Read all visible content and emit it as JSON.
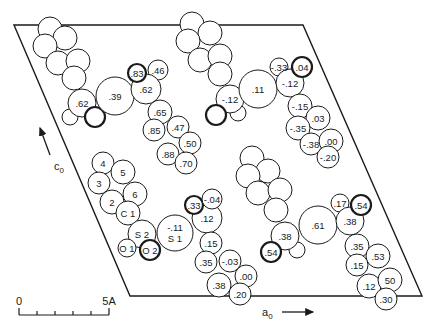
{
  "figure": {
    "type": "crystal-packing-projection",
    "unit_cell": {
      "points": [
        [
          14,
          25
        ],
        [
          303,
          25
        ],
        [
          422,
          296
        ],
        [
          130,
          296
        ]
      ]
    },
    "axes": {
      "c0": {
        "label": "c",
        "subscript": "0",
        "arrow": [
          [
            50,
            155
          ],
          [
            40,
            128
          ]
        ],
        "label_pos": [
          54,
          170
        ]
      },
      "a0": {
        "label": "a",
        "subscript": "0",
        "arrow": [
          [
            282,
            312
          ],
          [
            313,
            312
          ]
        ],
        "label_pos": [
          262,
          316
        ]
      }
    },
    "scale_bar": {
      "x0": 19,
      "x1": 109,
      "y": 315,
      "ticks": 5,
      "start_label": "0",
      "end_label": "5A"
    },
    "molecules": [
      {
        "name": "top-left-molecule",
        "atoms": [
          {
            "x": 50,
            "y": 29,
            "r": 12,
            "label": ""
          },
          {
            "x": 65,
            "y": 38,
            "r": 12,
            "label": ""
          },
          {
            "x": 45,
            "y": 46,
            "r": 12,
            "label": ""
          },
          {
            "x": 58,
            "y": 63,
            "r": 12,
            "label": ""
          },
          {
            "x": 78,
            "y": 61,
            "r": 12,
            "label": ""
          },
          {
            "x": 74,
            "y": 78,
            "r": 12,
            "label": ""
          },
          {
            "x": 70,
            "y": 117,
            "r": 8,
            "label": ""
          },
          {
            "x": 82,
            "y": 103,
            "r": 14,
            "label": ".62"
          },
          {
            "x": 95,
            "y": 117,
            "r": 10,
            "label": "",
            "bold": true
          },
          {
            "x": 115,
            "y": 96,
            "r": 19,
            "label": ".39"
          },
          {
            "x": 158,
            "y": 70,
            "r": 10,
            "label": ".46"
          },
          {
            "x": 146,
            "y": 89,
            "r": 15,
            "label": ".62"
          },
          {
            "x": 137,
            "y": 73,
            "r": 9,
            "label": ".83",
            "bold": true
          },
          {
            "x": 160,
            "y": 112,
            "r": 12,
            "label": ".65"
          },
          {
            "x": 154,
            "y": 130,
            "r": 11,
            "label": ".85"
          },
          {
            "x": 178,
            "y": 127,
            "r": 11,
            "label": ".47"
          },
          {
            "x": 190,
            "y": 143,
            "r": 11,
            "label": ".50"
          },
          {
            "x": 168,
            "y": 154,
            "r": 11,
            "label": ".88"
          },
          {
            "x": 186,
            "y": 163,
            "r": 11,
            "label": ".70"
          }
        ]
      },
      {
        "name": "top-right-molecule",
        "atoms": [
          {
            "x": 192,
            "y": 24,
            "r": 12,
            "label": ""
          },
          {
            "x": 210,
            "y": 33,
            "r": 12,
            "label": ""
          },
          {
            "x": 188,
            "y": 41,
            "r": 12,
            "label": ""
          },
          {
            "x": 200,
            "y": 60,
            "r": 12,
            "label": ""
          },
          {
            "x": 220,
            "y": 56,
            "r": 12,
            "label": ""
          },
          {
            "x": 220,
            "y": 74,
            "r": 12,
            "label": ""
          },
          {
            "x": 238,
            "y": 113,
            "r": 8,
            "label": ""
          },
          {
            "x": 230,
            "y": 99,
            "r": 14,
            "label": "-.12"
          },
          {
            "x": 216,
            "y": 115,
            "r": 10,
            "label": "",
            "bold": true
          },
          {
            "x": 258,
            "y": 89,
            "r": 19,
            "label": ".11"
          },
          {
            "x": 279,
            "y": 67,
            "r": 9,
            "label": "-.33"
          },
          {
            "x": 290,
            "y": 83,
            "r": 14,
            "label": "-.12"
          },
          {
            "x": 302,
            "y": 67,
            "r": 10,
            "label": ".04",
            "bold": true
          },
          {
            "x": 300,
            "y": 106,
            "r": 12,
            "label": "-.15"
          },
          {
            "x": 318,
            "y": 118,
            "r": 12,
            "label": ".03"
          },
          {
            "x": 298,
            "y": 128,
            "r": 12,
            "label": "-.35"
          },
          {
            "x": 311,
            "y": 144,
            "r": 11,
            "label": "-.38"
          },
          {
            "x": 331,
            "y": 141,
            "r": 12,
            "label": ".00"
          },
          {
            "x": 328,
            "y": 157,
            "r": 11,
            "label": "-.20"
          }
        ]
      },
      {
        "name": "central-sulfonyl-molecule",
        "atoms": [
          {
            "x": 103,
            "y": 163,
            "r": 11,
            "label": "4"
          },
          {
            "x": 123,
            "y": 172,
            "r": 12,
            "label": "5"
          },
          {
            "x": 99,
            "y": 183,
            "r": 11,
            "label": "3"
          },
          {
            "x": 112,
            "y": 202,
            "r": 12,
            "label": "2"
          },
          {
            "x": 135,
            "y": 194,
            "r": 12,
            "label": "6"
          },
          {
            "x": 128,
            "y": 213,
            "r": 12,
            "label": "C 1"
          },
          {
            "x": 142,
            "y": 234,
            "r": 14,
            "label": "S 2"
          },
          {
            "x": 127,
            "y": 248,
            "r": 9,
            "label": "O 1"
          },
          {
            "x": 150,
            "y": 250,
            "r": 10,
            "label": "O 2",
            "bold": true
          },
          {
            "x": 175,
            "y": 233,
            "r": 18,
            "label": "-.11\nS 1"
          },
          {
            "x": 207,
            "y": 218,
            "r": 15,
            "label": ".12"
          },
          {
            "x": 194,
            "y": 205,
            "r": 9,
            "label": ".33",
            "bold": true
          },
          {
            "x": 212,
            "y": 199,
            "r": 10,
            "label": "-.04"
          },
          {
            "x": 211,
            "y": 243,
            "r": 11,
            "label": ".15"
          },
          {
            "x": 206,
            "y": 262,
            "r": 11,
            "label": ".35"
          },
          {
            "x": 230,
            "y": 261,
            "r": 11,
            "label": "-.03"
          },
          {
            "x": 219,
            "y": 285,
            "r": 12,
            "label": ".38"
          },
          {
            "x": 246,
            "y": 276,
            "r": 11,
            "label": ".00"
          },
          {
            "x": 240,
            "y": 294,
            "r": 11,
            "label": ".20"
          }
        ]
      },
      {
        "name": "bottom-right-molecule",
        "atoms": [
          {
            "x": 252,
            "y": 158,
            "r": 12,
            "label": ""
          },
          {
            "x": 268,
            "y": 171,
            "r": 12,
            "label": ""
          },
          {
            "x": 248,
            "y": 176,
            "r": 12,
            "label": ""
          },
          {
            "x": 258,
            "y": 193,
            "r": 12,
            "label": ""
          },
          {
            "x": 280,
            "y": 190,
            "r": 12,
            "label": ""
          },
          {
            "x": 276,
            "y": 210,
            "r": 12,
            "label": ""
          },
          {
            "x": 297,
            "y": 250,
            "r": 8,
            "label": ""
          },
          {
            "x": 285,
            "y": 236,
            "r": 14,
            "label": ".38"
          },
          {
            "x": 271,
            "y": 252,
            "r": 10,
            "label": ".54",
            "bold": true
          },
          {
            "x": 318,
            "y": 225,
            "r": 19,
            "label": ".61"
          },
          {
            "x": 340,
            "y": 203,
            "r": 9,
            "label": ".17"
          },
          {
            "x": 350,
            "y": 221,
            "r": 14,
            "label": ".38"
          },
          {
            "x": 361,
            "y": 205,
            "r": 10,
            "label": ".54",
            "bold": true
          },
          {
            "x": 357,
            "y": 246,
            "r": 12,
            "label": ".35"
          },
          {
            "x": 378,
            "y": 256,
            "r": 12,
            "label": ".53"
          },
          {
            "x": 357,
            "y": 265,
            "r": 11,
            "label": ".15"
          },
          {
            "x": 369,
            "y": 286,
            "r": 12,
            "label": ".12"
          },
          {
            "x": 390,
            "y": 280,
            "r": 12,
            "label": "50"
          },
          {
            "x": 386,
            "y": 299,
            "r": 11,
            "label": ".30"
          }
        ]
      }
    ]
  }
}
